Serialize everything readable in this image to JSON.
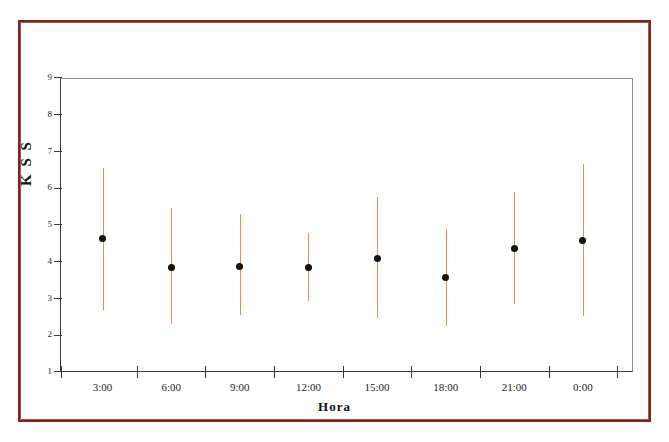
{
  "figure": {
    "border_color": "#7d2621",
    "background": "#ffffff"
  },
  "chart_data": {
    "type": "scatter",
    "title": "",
    "subtitle": "",
    "xlabel": "Hora",
    "ylabel": "K S S",
    "categories": [
      "3:00",
      "6:00",
      "9:00",
      "12:00",
      "15:00",
      "18:00",
      "21:00",
      "0:00"
    ],
    "values": [
      4.62,
      3.84,
      3.88,
      3.83,
      4.1,
      3.57,
      4.37,
      4.57
    ],
    "error_low": [
      2.7,
      2.31,
      2.54,
      2.93,
      2.47,
      2.26,
      2.85,
      2.53
    ],
    "error_high": [
      6.55,
      5.46,
      5.29,
      4.78,
      5.77,
      4.88,
      5.89,
      6.67
    ],
    "ylim": [
      1,
      9
    ],
    "yticks": [
      1,
      2,
      3,
      4,
      5,
      6,
      7,
      8,
      9
    ],
    "ytick_labels": [
      "1",
      "2",
      "3",
      "4",
      "5",
      "6",
      "7",
      "8",
      "9"
    ],
    "grid": false,
    "legend": null,
    "marker_color": "#111111",
    "errorbar_color": "#eb8b52",
    "annotations": []
  },
  "axes": {
    "y_title": "K S S",
    "x_title": "Hora"
  }
}
